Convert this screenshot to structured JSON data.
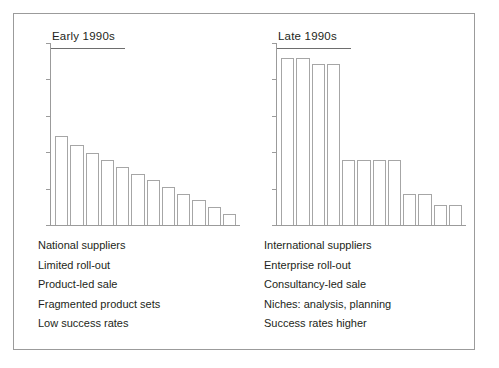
{
  "figure": {
    "border_color": "#9b9b9b",
    "background": "#ffffff",
    "bar_outline_color": "#a6a6a6",
    "text_color": "#231f20"
  },
  "panels": [
    {
      "id": "early-1990s",
      "title": "Early 1990s",
      "notes": [
        "National suppliers",
        "Limited roll-out",
        "Product-led sale",
        "Fragmented product sets",
        "Low success rates"
      ]
    },
    {
      "id": "late-1990s",
      "title": "Late 1990s",
      "notes": [
        "International suppliers",
        "Enterprise roll-out",
        "Consultancy-led sale",
        "Niches: analysis, planning",
        "Success rates higher"
      ]
    }
  ],
  "chart_data": [
    {
      "type": "bar",
      "title": "Early 1990s",
      "xlabel": "",
      "ylabel": "",
      "ylim": [
        0,
        100
      ],
      "grid": false,
      "legend": "none",
      "axis_tick_count": 6,
      "tick_values": [
        0,
        20,
        40,
        60,
        80,
        100
      ],
      "tick_labels_shown": false,
      "categories": [
        "1",
        "2",
        "3",
        "4",
        "5",
        "6",
        "7",
        "8",
        "9",
        "10",
        "11",
        "12"
      ],
      "values": [
        49,
        44,
        40,
        36,
        32,
        28,
        25,
        21,
        17,
        14,
        10,
        6
      ]
    },
    {
      "type": "bar",
      "title": "Late 1990s",
      "xlabel": "",
      "ylabel": "",
      "ylim": [
        0,
        100
      ],
      "grid": false,
      "legend": "none",
      "axis_tick_count": 6,
      "tick_values": [
        0,
        20,
        40,
        60,
        80,
        100
      ],
      "tick_labels_shown": false,
      "categories": [
        "1",
        "2",
        "3",
        "4",
        "5",
        "6",
        "7",
        "8",
        "9",
        "10",
        "11",
        "12"
      ],
      "values": [
        92,
        92,
        89,
        89,
        36,
        36,
        36,
        36,
        17,
        17,
        11,
        11
      ]
    }
  ]
}
